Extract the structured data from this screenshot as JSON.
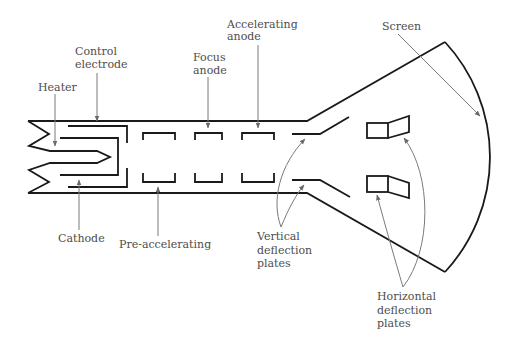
{
  "diagram": {
    "labels": {
      "control_electrode": [
        "Control",
        "electrode"
      ],
      "heater": [
        "Heater"
      ],
      "focus_anode": [
        "Focus",
        "anode"
      ],
      "accelerating_anode": [
        "Accelerating",
        "anode"
      ],
      "screen": [
        "Screen"
      ],
      "cathode": [
        "Cathode"
      ],
      "pre_accelerating": [
        "Pre-accelerating"
      ],
      "vertical_deflection_plates": [
        "Vertical",
        "deflection",
        "plates"
      ],
      "horizontal_deflection_plates": [
        "Horizontal",
        "deflection",
        "plates"
      ]
    },
    "colors": {
      "line": "#1a1a1a",
      "leader": "#7a7a7a",
      "text": "#4d4d4d",
      "background": "#ffffff"
    }
  }
}
